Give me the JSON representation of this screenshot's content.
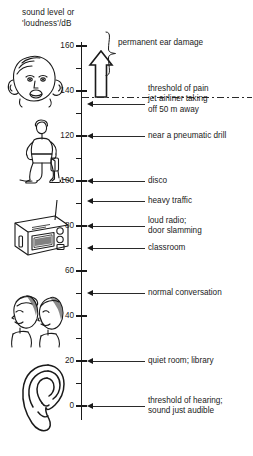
{
  "chart_data": {
    "type": "bar",
    "title": "sound level or\n'loudness'/dB",
    "ylabel": "sound level or 'loudness'/dB",
    "xlabel": "",
    "ylim": [
      0,
      165
    ],
    "grid": false,
    "legend_position": "none",
    "tick_labels": [
      "160",
      "140",
      "120",
      "100",
      "80",
      "60",
      "40",
      "20",
      "0"
    ],
    "tick_values": [
      160,
      140,
      120,
      100,
      80,
      60,
      40,
      20,
      0
    ],
    "minor_tick_values": [
      150,
      130,
      110,
      90,
      70,
      50,
      30,
      10
    ],
    "categories": [
      "jet airliner taking off 50 m away",
      "near a pneumatic drill",
      "disco",
      "heavy traffic",
      "loud radio; door slamming",
      "classroom",
      "normal conversation",
      "quiet room; library",
      "threshold of hearing; sound just audible"
    ],
    "values": [
      134,
      120,
      100,
      91,
      80,
      70,
      50,
      20,
      0
    ],
    "annotations": [
      {
        "label": "permanent ear damage",
        "range": [
          140,
          165
        ]
      },
      {
        "label": "threshold of pain",
        "value": 135
      }
    ]
  },
  "axis": {
    "title": "sound level or\n'loudness'/dB",
    "ticks": [
      {
        "label": "160",
        "value": 160
      },
      {
        "label": "140",
        "value": 140
      },
      {
        "label": "120",
        "value": 120
      },
      {
        "label": "100",
        "value": 100
      },
      {
        "label": "80",
        "value": 80
      },
      {
        "label": "60",
        "value": 60
      },
      {
        "label": "40",
        "value": 40
      },
      {
        "label": "20",
        "value": 20
      },
      {
        "label": "0",
        "value": 0
      }
    ],
    "minor_ticks": [
      150,
      130,
      110,
      90,
      70,
      50,
      30,
      10
    ]
  },
  "brace": {
    "label": "permanent ear damage"
  },
  "threshold": {
    "label": "threshold of pain"
  },
  "callouts": [
    {
      "label": "jet airliner taking\noff 50 m away",
      "value": 134
    },
    {
      "label": "near a pneumatic drill",
      "value": 120
    },
    {
      "label": "disco",
      "value": 100
    },
    {
      "label": "heavy traffic",
      "value": 91
    },
    {
      "label": "loud radio;\ndoor slamming",
      "value": 80
    },
    {
      "label": "classroom",
      "value": 70
    },
    {
      "label": "normal conversation",
      "value": 50
    },
    {
      "label": "quiet room; library",
      "value": 20
    },
    {
      "label": "threshold of hearing;\nsound just audible",
      "value": 0
    }
  ],
  "illustrations": [
    {
      "name": "screaming-face-ear-damage-illustration"
    },
    {
      "name": "pneumatic-drill-worker-illustration"
    },
    {
      "name": "radio-illustration"
    },
    {
      "name": "two-faces-conversation-illustration"
    },
    {
      "name": "ear-illustration"
    }
  ],
  "colors": {
    "ink": "#1a1a1a",
    "background": "#ffffff"
  }
}
